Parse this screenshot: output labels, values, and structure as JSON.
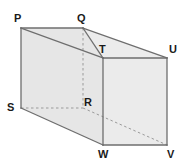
{
  "figure": {
    "name": "rectangular-prism",
    "shape_type": "cuboid",
    "background_color": "#ffffff",
    "faces": {
      "front_left_color": "#e6e6e6",
      "top_color": "#ececec",
      "right_color": "#ebebeb",
      "edge_color": "#6e6e6e",
      "hidden_edge_color": "#9a9a9a"
    },
    "vertices": [
      {
        "label": "P",
        "x": 21,
        "y": 28,
        "label_x": 14,
        "label_y": 13
      },
      {
        "label": "Q",
        "x": 83,
        "y": 28,
        "label_x": 77,
        "label_y": 13
      },
      {
        "label": "T",
        "x": 103,
        "y": 58,
        "label_x": 99,
        "label_y": 44
      },
      {
        "label": "U",
        "x": 167,
        "y": 58,
        "label_x": 169,
        "label_y": 44
      },
      {
        "label": "S",
        "x": 21,
        "y": 108,
        "label_x": 7,
        "label_y": 102
      },
      {
        "label": "R",
        "x": 83,
        "y": 108,
        "label_x": 84,
        "label_y": 97
      },
      {
        "label": "W",
        "x": 103,
        "y": 145,
        "label_x": 98,
        "label_y": 149
      },
      {
        "label": "V",
        "x": 167,
        "y": 145,
        "label_x": 167,
        "label_y": 149
      }
    ],
    "solid_edges": [
      [
        "P",
        "Q"
      ],
      [
        "Q",
        "U"
      ],
      [
        "U",
        "V"
      ],
      [
        "V",
        "W"
      ],
      [
        "W",
        "S"
      ],
      [
        "S",
        "P"
      ],
      [
        "T",
        "U"
      ],
      [
        "T",
        "W"
      ],
      [
        "P",
        "T"
      ],
      [
        "Q",
        "T"
      ]
    ],
    "hidden_edges": [
      [
        "Q",
        "R"
      ],
      [
        "S",
        "R"
      ],
      [
        "R",
        "V"
      ]
    ]
  }
}
